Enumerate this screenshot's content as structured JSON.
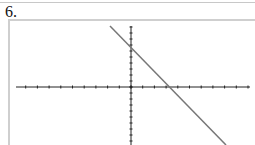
{
  "problem": {
    "number_label": "6."
  },
  "graph": {
    "description": "Line with negative slope on coordinate axes",
    "x_axis": {
      "y_px": 87,
      "x_start_px": 16,
      "x_end_px": 250,
      "origin_x_px": 131,
      "tick_spacing_px": 11.7
    },
    "y_axis": {
      "x_px": 131,
      "y_start_px": 26,
      "y_end_px": 145,
      "tick_spacing_px": 6
    },
    "line": {
      "x1": 110,
      "y1": 26,
      "x2": 226,
      "y2": 145,
      "color": "#777777"
    },
    "axis_color": "#222222"
  },
  "chart_data": {
    "type": "line",
    "title": "",
    "xlabel": "",
    "ylabel": "",
    "series": [
      {
        "name": "line",
        "x": [
          -2,
          4
        ],
        "y": [
          10,
          -8
        ]
      }
    ],
    "grid": false
  }
}
